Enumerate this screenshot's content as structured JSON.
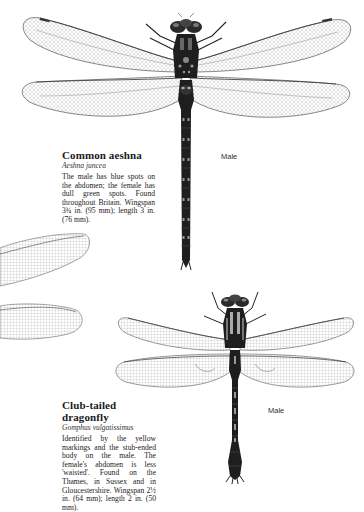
{
  "species": [
    {
      "common_name": "Common aeshna",
      "latin_name": "Aeshna juncea",
      "description": "The male has blue spots on the abdomen; the female has dull green spots. Found throughout Britain. Wingspan 3¾ in. (95 mm); length 3 in. (76 mm).",
      "illustration_label": "Male",
      "icon": "dragonfly-illustration"
    },
    {
      "common_name": "Club-tailed dragonfly",
      "latin_name": "Gomphus vulgatissimus",
      "description": "Identified by the yellow markings and the stub-ended body on the male. The female's abdomen is less 'waisted'. Found on the Thames, in Sussex and in Gloucestershire. Wingspan 2½ in. (64 mm); length 2 in. (50 mm).",
      "illustration_label": "Male",
      "icon": "dragonfly-illustration"
    }
  ],
  "colors": {
    "ink": "#1a1a1a",
    "wing_vein": "#6a6a6a",
    "body_dark": "#1e1e1e",
    "background": "#ffffff"
  }
}
